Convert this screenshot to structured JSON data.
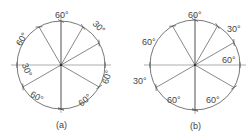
{
  "figures": [
    {
      "id": "a",
      "caption": "(a)",
      "center": [
        61,
        65
      ],
      "radius": 44,
      "spoke_angles_deg": [
        90,
        120,
        60,
        30,
        210,
        270,
        330
      ],
      "labels": [
        {
          "text": "60°",
          "x": 55,
          "y": 18,
          "rot": 0
        },
        {
          "text": "30°",
          "x": 92,
          "y": 30,
          "rot": 45
        },
        {
          "text": "60°",
          "x": 15,
          "y": 42,
          "rot": -60
        },
        {
          "text": "30°",
          "x": 20,
          "y": 73,
          "rot": 70
        },
        {
          "text": "60°",
          "x": 30,
          "y": 100,
          "rot": 30
        },
        {
          "text": "60°",
          "x": 78,
          "y": 103,
          "rot": -40
        },
        {
          "text": "60°",
          "x": 100,
          "y": 80,
          "rot": -75
        }
      ]
    },
    {
      "id": "b",
      "caption": "(b)",
      "center": [
        195,
        65
      ],
      "radius": 45,
      "spoke_angles_deg": [
        90,
        120,
        60,
        30,
        210,
        270,
        330
      ],
      "labels": [
        {
          "text": "60°",
          "x": 188,
          "y": 18,
          "rot": 0
        },
        {
          "text": "30°",
          "x": 227,
          "y": 32,
          "rot": 0
        },
        {
          "text": "60°",
          "x": 142,
          "y": 45,
          "rot": 0
        },
        {
          "text": "60°",
          "x": 222,
          "y": 63,
          "rot": 0
        },
        {
          "text": "30°",
          "x": 133,
          "y": 84,
          "rot": 0
        },
        {
          "text": "60°",
          "x": 167,
          "y": 103,
          "rot": 0
        },
        {
          "text": "60°",
          "x": 206,
          "y": 103,
          "rot": 0
        }
      ]
    }
  ]
}
